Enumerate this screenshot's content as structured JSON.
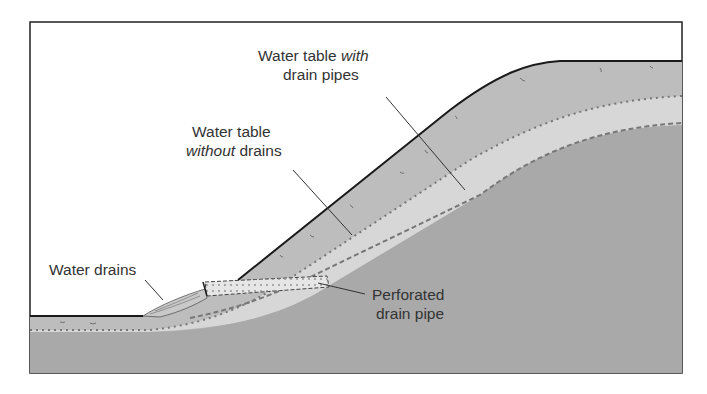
{
  "diagram": {
    "labels": {
      "with_drains": {
        "line1_a": "Water table ",
        "line1_b": "with",
        "line2": "drain pipes"
      },
      "without_drains": {
        "line1": "Water table",
        "line2_a": "without",
        "line2_b": " drains"
      },
      "water_drains": "Water drains",
      "pipe": {
        "line1": "Perforated",
        "line2": "drain pipe"
      }
    },
    "colors": {
      "background": "#ffffff",
      "frame": "#222222",
      "soil_upper": "#bdbdbd",
      "soil_lower": "#a9a9a9",
      "saturated_band": "#d6d6d6",
      "pipe": "#e4e4e4",
      "water_table_line": "#777777",
      "text": "#333333"
    }
  }
}
